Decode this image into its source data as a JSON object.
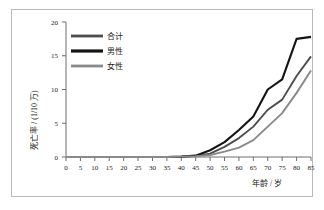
{
  "chart_data": {
    "type": "line",
    "title": "",
    "xlabel": "年龄 / 岁",
    "ylabel": "死亡率 / (1/10 万)",
    "xlim": [
      0,
      85
    ],
    "ylim": [
      0,
      20
    ],
    "x": [
      0,
      5,
      10,
      15,
      20,
      25,
      30,
      35,
      40,
      45,
      50,
      55,
      60,
      65,
      70,
      75,
      80,
      85
    ],
    "xticks": [
      "0",
      "5",
      "10",
      "15",
      "20",
      "25",
      "30",
      "35",
      "40",
      "45",
      "50",
      "55",
      "60",
      "65",
      "70",
      "75",
      "80",
      "85"
    ],
    "yticks": [
      "0",
      "5",
      "10",
      "15",
      "20"
    ],
    "grid": false,
    "legend_position": "upper-left-inside",
    "series": [
      {
        "name": "合计",
        "color": "#4d4d4d",
        "values": [
          0,
          0,
          0,
          0,
          0,
          0,
          0,
          0,
          0.05,
          0.15,
          0.5,
          1.5,
          2.8,
          4.5,
          7.0,
          8.5,
          12.0,
          14.9
        ]
      },
      {
        "name": "男性",
        "color": "#141414",
        "values": [
          0,
          0,
          0,
          0,
          0,
          0,
          0,
          0,
          0.05,
          0.2,
          1.0,
          2.2,
          4.0,
          6.0,
          10.0,
          11.5,
          17.5,
          17.8
        ]
      },
      {
        "name": "女性",
        "color": "#8a8a8a",
        "values": [
          0,
          0,
          0,
          0,
          0,
          0,
          0,
          0,
          0.05,
          0.1,
          0.3,
          0.8,
          1.4,
          2.5,
          4.5,
          6.5,
          9.5,
          12.8
        ]
      }
    ]
  },
  "legend": {
    "items": [
      {
        "label": "合计"
      },
      {
        "label": "男性"
      },
      {
        "label": "女性"
      }
    ]
  },
  "axes": {
    "y_title": "死亡率 / (1/10 万)",
    "x_title": "年龄 / 岁"
  }
}
